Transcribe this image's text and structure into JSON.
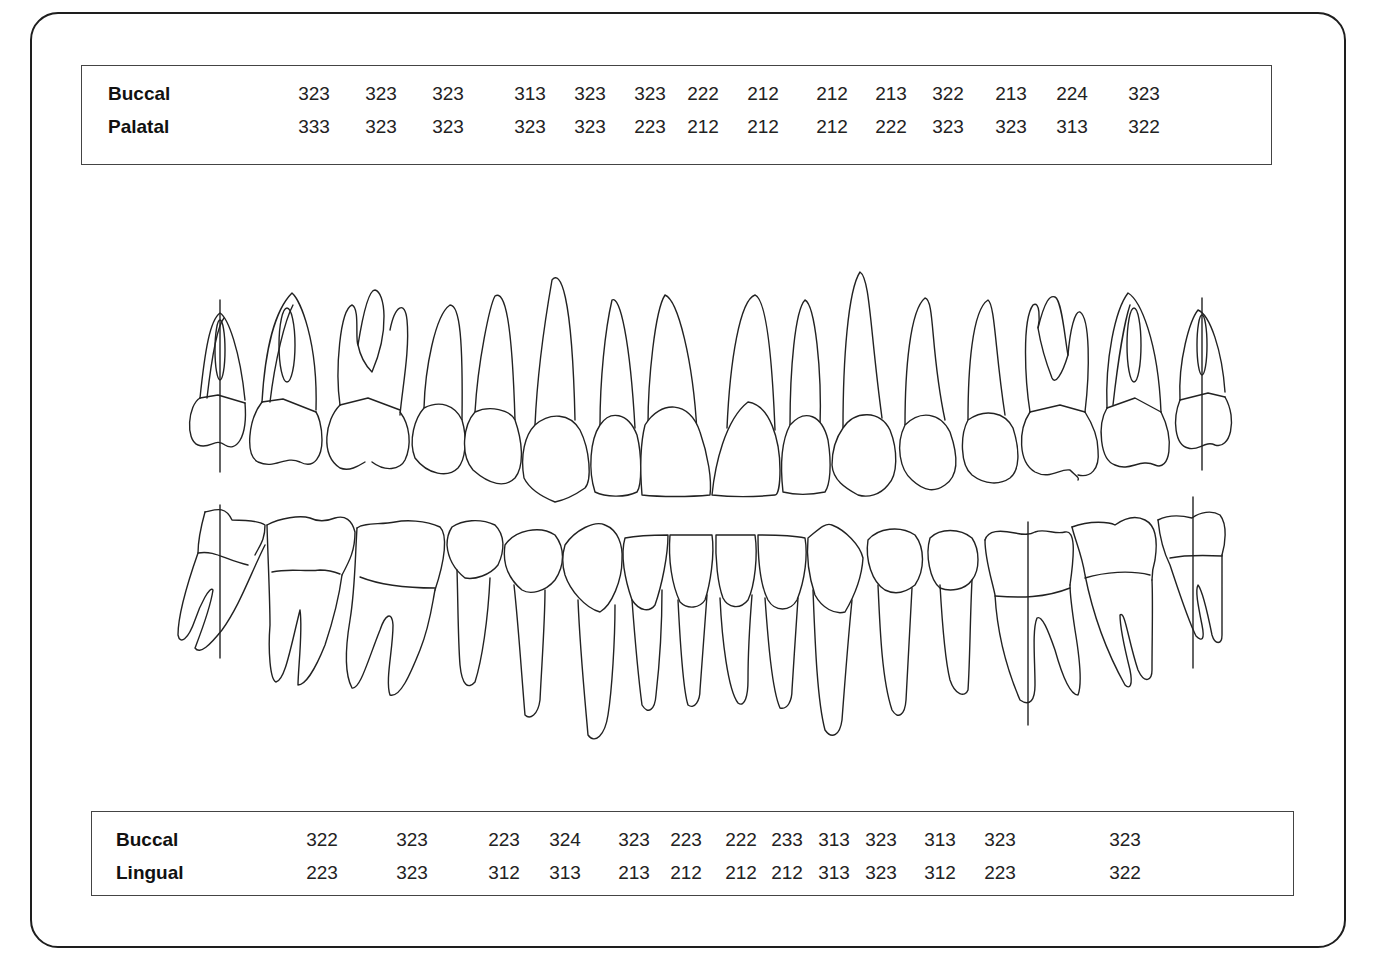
{
  "upper_table": {
    "rows": [
      {
        "label": "Buccal",
        "values": [
          "323",
          "323",
          "323",
          "313",
          "323",
          "323",
          "222",
          "212",
          "212",
          "213",
          "322",
          "213",
          "224",
          "323"
        ]
      },
      {
        "label": "Palatal",
        "values": [
          "333",
          "323",
          "323",
          "323",
          "323",
          "223",
          "212",
          "212",
          "212",
          "222",
          "323",
          "323",
          "313",
          "322"
        ]
      }
    ],
    "value_x": [
      313,
      380,
      447,
      529,
      589,
      649,
      702,
      762,
      831,
      890,
      947,
      1010,
      1071,
      1143
    ]
  },
  "lower_table": {
    "rows": [
      {
        "label": "Buccal",
        "values": [
          "322",
          "323",
          "223",
          "324",
          "323",
          "223",
          "222",
          "233",
          "313",
          "323",
          "313",
          "323",
          "323"
        ]
      },
      {
        "label": "Lingual",
        "values": [
          "223",
          "323",
          "312",
          "313",
          "213",
          "212",
          "212",
          "212",
          "313",
          "323",
          "312",
          "223",
          "322"
        ]
      }
    ],
    "value_x": [
      321,
      411,
      503,
      564,
      633,
      685,
      740,
      786,
      833,
      880,
      939,
      999,
      1124
    ]
  },
  "diagram": {
    "upper_arch": "maxillary teeth (buccal view)",
    "lower_arch": "mandibular teeth (buccal view)",
    "line_color": "#222222"
  }
}
